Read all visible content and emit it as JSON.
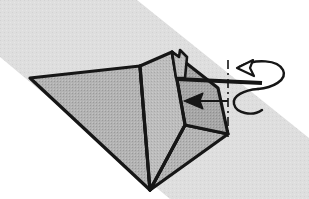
{
  "document": {
    "type": "origami-instruction-diagram",
    "title": "Origami fold step — rotate / turn model",
    "canvas": {
      "width": 309,
      "height": 199
    },
    "background_color": "#ffffff"
  },
  "palette": {
    "paper_fill": "#b3b3b3",
    "paper_fill_shadow": "#a6a6a6",
    "paper_fill_light": "#bdbdbd",
    "outline": "#161616",
    "background_band": "#dedede",
    "background_band_edge": "#d2d2d2",
    "arrow_fill": "#ffffff",
    "arrow_stroke": "#161616",
    "axis_line": "#161616",
    "page_white": "#ffffff"
  },
  "background_band": {
    "name": "diagonal-gray-band",
    "description": "Light gray diagonal band running from upper-left to lower-right behind the model",
    "points": "0,0 137,0 309,138 309,199 170,199 0,57",
    "fill_key": "background_band"
  },
  "model": {
    "name": "folded-paper-model",
    "description": "Gray folded paper form with a large left wing, a central vertical spine, a right wing and a small raised flap at the apex",
    "facets": [
      {
        "id": "left-wing",
        "label": "Left wing facet",
        "points": "30,78 140,66 150,190",
        "fill_key": "paper_fill",
        "stroke_key": "outline",
        "stroke_width": 3.2
      },
      {
        "id": "center-spine",
        "label": "Center spine facet",
        "points": "140,66 172,52 185,125 150,190",
        "fill_key": "paper_fill_light",
        "stroke_key": "outline",
        "stroke_width": 3.2
      },
      {
        "id": "right-wing",
        "label": "Right wing facet",
        "points": "172,52 218,88 228,134 185,125",
        "fill_key": "paper_fill_shadow",
        "stroke_key": "outline",
        "stroke_width": 3.2
      },
      {
        "id": "lower-right-gusset",
        "label": "Lower right gusset",
        "points": "185,125 228,134 150,190",
        "fill_key": "paper_fill",
        "stroke_key": "outline",
        "stroke_width": 3.2
      },
      {
        "id": "apex-flap",
        "label": "Small raised flap at apex",
        "points": "172,52 179,57 180,50 187,57 185,78 176,78",
        "fill_key": "paper_fill_light",
        "stroke_key": "outline",
        "stroke_width": 2.6
      }
    ],
    "fold_lines": [
      {
        "id": "spine-left-crease",
        "from": [
          140,
          66
        ],
        "to": [
          150,
          190
        ],
        "stroke_width": 3.0
      },
      {
        "id": "spine-right-crease",
        "from": [
          185,
          125
        ],
        "to": [
          150,
          190
        ],
        "stroke_width": 3.0
      },
      {
        "id": "apex-crease",
        "from": [
          172,
          52
        ],
        "to": [
          185,
          125
        ],
        "stroke_width": 2.6
      }
    ],
    "horizontal_edge": {
      "id": "horizontal-folded-edge",
      "label": "Thick horizontal folded edge at right",
      "from": [
        176,
        79
      ],
      "to": [
        262,
        83
      ],
      "stroke_width": 4.2
    }
  },
  "annotations": {
    "rotation_axis": {
      "name": "rotation-axis-dash-dot-line",
      "label": "Axis of rotation (dash-dot vertical line)",
      "x": 228,
      "y_top": 60,
      "y_bottom": 137,
      "dash_pattern": "9 4 2 4",
      "stroke_width": 1.6,
      "stroke_key": "axis_line"
    },
    "turn_over_arrow": {
      "name": "turn-over-rotation-arrow",
      "label": "Turn-over / rotate arrow looping around the folded edge",
      "description": "Hollow outlined arrow that loops behind the horizontal edge, arrowhead pointing left at the top",
      "upper_loop_path": "M 239,67 C 256,58 278,60 283,70 C 288,80 272,88 258,89",
      "lower_loop_path": "M 258,89 C 244,90 232,96 234,104 C 236,113 252,117 262,110",
      "head_path": "M 253,60 L 237,68 L 254,76 L 250,68 Z",
      "stroke_width": 2.4,
      "fill_key": "arrow_fill",
      "stroke_key": "arrow_stroke"
    },
    "direction_arrow": {
      "name": "fold-direction-arrow-left",
      "label": "Solid left-pointing arrow indicating fold direction",
      "shaft_from": [
        228,
        101
      ],
      "shaft_to": [
        196,
        101
      ],
      "head_path": "M 184,101 L 203,93 L 200,101 L 203,109 Z",
      "stroke_width": 2.0,
      "fill_key": "arrow_stroke",
      "stroke_key": "arrow_stroke"
    }
  },
  "texts": {
    "visible_labels": [],
    "note": "No textual labels are printed in this diagram"
  }
}
